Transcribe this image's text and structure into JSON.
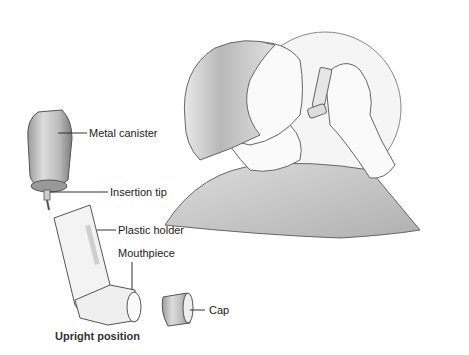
{
  "figure": {
    "labels": {
      "metal_canister": "Metal canister",
      "insertion_tip": "Insertion tip",
      "plastic_holder": "Plastic holder",
      "mouthpiece": "Mouthpiece",
      "cap": "Cap"
    },
    "caption": "Upright position",
    "colors": {
      "line": "#555555",
      "fill_light": "#f2f2f2",
      "shade": "#b5b5b5",
      "shirt": "#c8c8c8"
    }
  }
}
